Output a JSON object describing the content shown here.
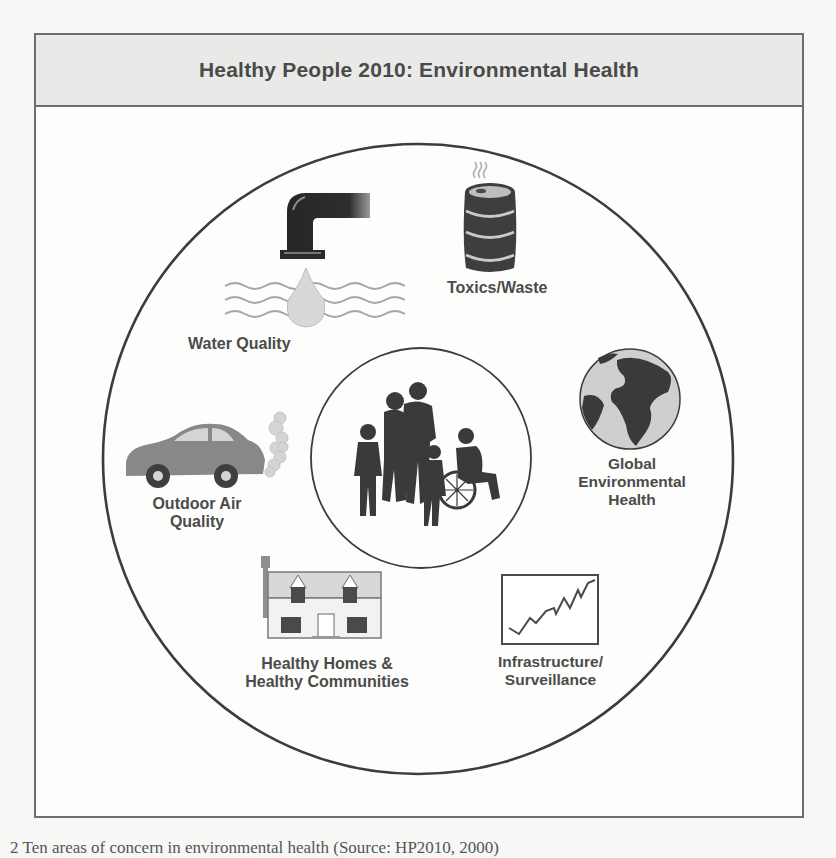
{
  "figure": {
    "title": "Healthy People 2010:  Environmental Health",
    "center": {
      "icon": "family-silhouette-icon",
      "description": "Family group silhouettes including person in wheelchair"
    },
    "topics": [
      {
        "id": "water-quality",
        "label": "Water Quality",
        "icon": "faucet-water-drop-icon"
      },
      {
        "id": "toxics-waste",
        "label": "Toxics/Waste",
        "icon": "toxic-barrel-icon"
      },
      {
        "id": "global-environmental-health",
        "label_lines": [
          "Global",
          "Environmental",
          "Health"
        ],
        "icon": "globe-icon"
      },
      {
        "id": "infrastructure-surveillance",
        "label_lines": [
          "Infrastructure/",
          "Surveillance"
        ],
        "icon": "trend-chart-icon"
      },
      {
        "id": "healthy-homes",
        "label_lines": [
          "Healthy Homes &",
          "Healthy Communities"
        ],
        "icon": "house-icon"
      },
      {
        "id": "outdoor-air-quality",
        "label_lines": [
          "Outdoor Air",
          "Quality"
        ],
        "icon": "car-exhaust-icon"
      }
    ],
    "colors": {
      "frame_border": "#6d6d6d",
      "header_fill": "#e9e9e7",
      "icon_dark": "#3f3f3f",
      "icon_mid": "#8a8a8a",
      "icon_light": "#d4d4d4"
    }
  },
  "page": {
    "caption_fragment": "2  Ten areas of concern in environmental health (Source: HP2010, 2000)"
  }
}
